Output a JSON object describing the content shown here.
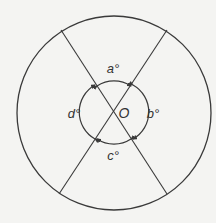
{
  "diagram": {
    "type": "circle-with-intersecting-chords",
    "colors": {
      "stroke": "#3a3a3a",
      "background": "#f4f4f2",
      "text": "#333333"
    },
    "outer_circle": {
      "cx": 114,
      "cy": 113,
      "r": 97
    },
    "inner_circle": {
      "cx": 114,
      "cy": 112,
      "r": 31
    },
    "center_label": "O",
    "lines": [
      {
        "name": "line-top-left-to-bottom-right",
        "x1": 61,
        "y1": 30,
        "x2": 167,
        "y2": 194
      },
      {
        "name": "line-top-right-to-bottom-left",
        "x1": 167,
        "y1": 30,
        "x2": 59,
        "y2": 194
      }
    ],
    "angle_labels": [
      {
        "name": "angle-a-label",
        "text": "a°",
        "x": 113,
        "y": 68
      },
      {
        "name": "angle-b-label",
        "text": "b°",
        "x": 153,
        "y": 113
      },
      {
        "name": "angle-c-label",
        "text": "c°",
        "x": 113,
        "y": 155
      },
      {
        "name": "angle-d-label",
        "text": "d°",
        "x": 74,
        "y": 113
      }
    ],
    "center_label_pos": {
      "x": 124,
      "y": 113
    }
  }
}
